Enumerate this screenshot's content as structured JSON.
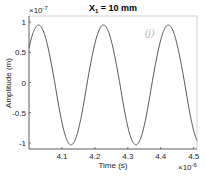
{
  "chart_data": {
    "type": "line",
    "title": "X1 = 10 mm",
    "title_main": "X",
    "title_sub": "1",
    "title_rest": " = 10 mm",
    "xlabel": "Time (s)",
    "ylabel": "Amplitude (m)",
    "x_exponent_label": "×10",
    "x_exponent": "-6",
    "y_exponent_label": "×10",
    "y_exponent": "-7",
    "annotation": "(j)",
    "xlim": [
      4.0,
      4.51
    ],
    "ylim": [
      -1.1,
      1.05
    ],
    "xticks": [
      4.1,
      4.2,
      4.3,
      4.4,
      4.5
    ],
    "xtick_labels": [
      "4.1",
      "4.2",
      "4.3",
      "4.4",
      "4.5"
    ],
    "yticks": [
      -1,
      -0.5,
      0,
      0.5,
      1
    ],
    "ytick_labels": [
      "-1",
      "-0.5",
      "0",
      "0.5",
      "1"
    ],
    "grid": false,
    "line_color": "#555555",
    "series": [
      {
        "name": "amplitude",
        "model": "A*cos(2*pi*(t - t_peak)/period)",
        "amplitude": 0.95,
        "period": 0.197,
        "t_peak": 4.029,
        "x": [
          4.0,
          4.029,
          4.128,
          4.226,
          4.325,
          4.423,
          4.51
        ],
        "values": [
          0.78,
          0.95,
          -1.03,
          0.95,
          -1.03,
          0.95,
          -1.0
        ]
      }
    ]
  }
}
